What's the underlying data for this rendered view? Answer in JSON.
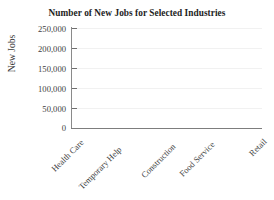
{
  "chart_data": {
    "type": "bar",
    "title": "Number of New Jobs for Selected Industries",
    "xlabel": "",
    "ylabel": "New Jobs",
    "categories": [
      "Health Care",
      "Temporary Help",
      "Construction",
      "Food Service",
      "Retail"
    ],
    "values": [
      null,
      null,
      null,
      null,
      null
    ],
    "series": [
      {
        "name": "New Jobs",
        "values": [
          null,
          null,
          null,
          null,
          null
        ]
      }
    ],
    "ytick_labels": [
      "250,000",
      "200,000",
      "150,000",
      "100,000",
      "50,000",
      "0"
    ],
    "ytick_values": [
      250000,
      200000,
      150000,
      100000,
      50000,
      0
    ],
    "ylim": [
      0,
      250000
    ],
    "grid": true,
    "grid_axis": "y",
    "legend": false,
    "legend_position": "none",
    "xtick_label_rotation": -45,
    "note": "empty plot template - axes and labels only, no bars drawn",
    "colors": {
      "background": "#ffffff",
      "axis": "#7d7d7d",
      "gridline": "#f1f1f1",
      "text": "#3d3d3d",
      "title_text": "#1d1d1d"
    }
  }
}
